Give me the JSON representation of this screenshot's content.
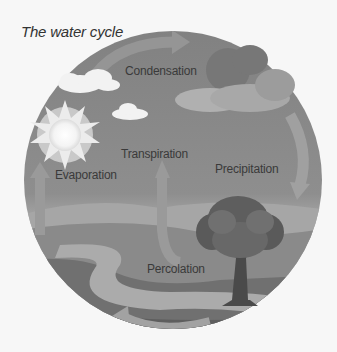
{
  "title": "The water cycle",
  "labels": {
    "condensation": "Condensation",
    "transpiration": "Transpiration",
    "precipitation": "Precipitation",
    "evaporation": "Evaporation",
    "percolation": "Percolation"
  },
  "colors": {
    "background": "#f7f7f7",
    "sky_top": "#858585",
    "sky_bottom": "#bdbdbd",
    "hills": "#a5a5a5",
    "ground_dark": "#6e6e6e",
    "river": "#a8a8a8",
    "arrow": "#9c9c9c",
    "text": "#3a3a3a"
  }
}
